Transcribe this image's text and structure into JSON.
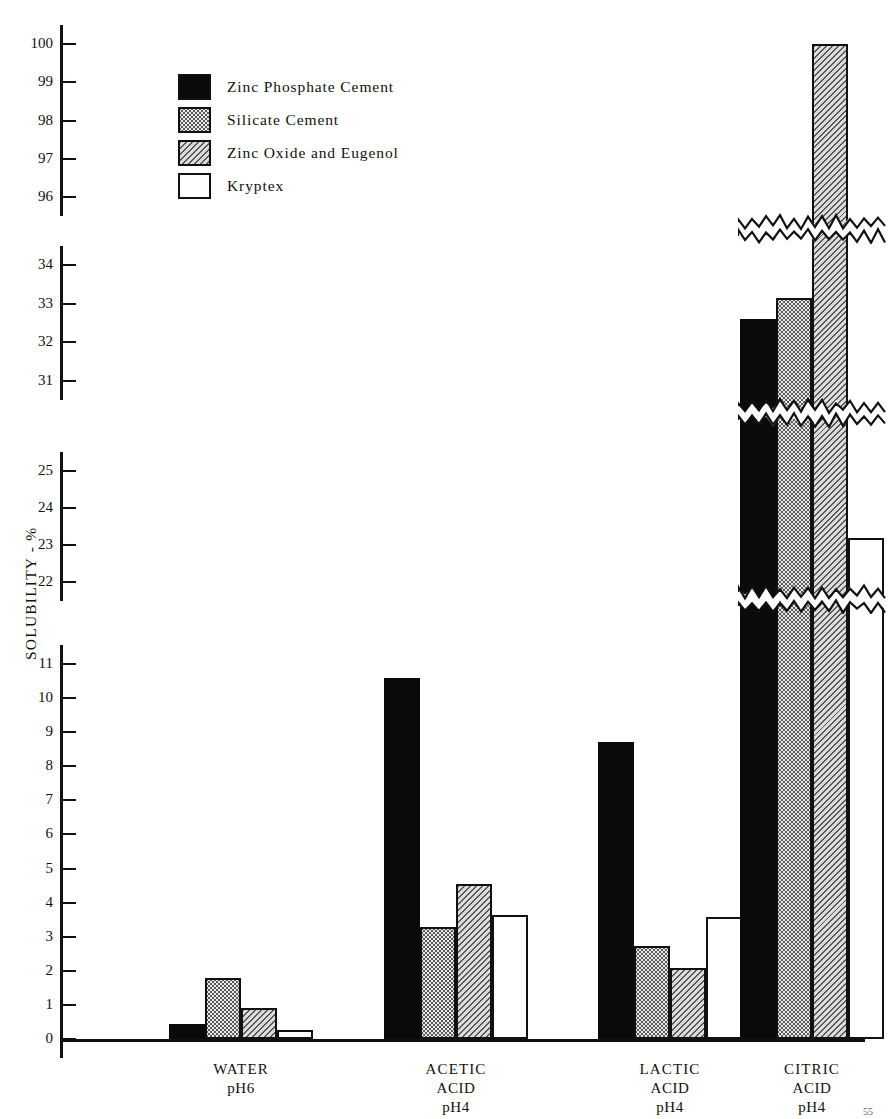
{
  "figure": {
    "ylabel": "SOLUBILITY - %",
    "corner_note": "55"
  },
  "legend": {
    "items": [
      {
        "label": "Zinc Phosphate Cement",
        "pattern": "solid",
        "swatch_name": "swatch-zinc-phosphate"
      },
      {
        "label": "Silicate Cement",
        "pattern": "dots",
        "swatch_name": "swatch-silicate"
      },
      {
        "label": "Zinc Oxide and Eugenol",
        "pattern": "hatch",
        "swatch_name": "swatch-zinc-oxide-eugenol"
      },
      {
        "label": "Kryptex",
        "pattern": "open",
        "swatch_name": "swatch-kryptex"
      }
    ]
  },
  "axis": {
    "segments": [
      {
        "name": "segment-96-100",
        "ticks": [
          "100",
          "99",
          "98",
          "97",
          "96"
        ]
      },
      {
        "name": "segment-31-34",
        "ticks": [
          "34",
          "33",
          "32",
          "31"
        ]
      },
      {
        "name": "segment-22-25",
        "ticks": [
          "25",
          "24",
          "23",
          "22"
        ]
      },
      {
        "name": "segment-0-11",
        "ticks": [
          "11",
          "10",
          "9",
          "8",
          "7",
          "6",
          "5",
          "4",
          "3",
          "2",
          "1",
          "0"
        ]
      }
    ]
  },
  "xaxis": {
    "groups": [
      {
        "name": "WATER",
        "line1": "WATER",
        "line2": "pH6",
        "line3": ""
      },
      {
        "name": "ACETIC",
        "line1": "ACETIC",
        "line2": "ACID",
        "line3": "pH4"
      },
      {
        "name": "LACTIC",
        "line1": "LACTIC",
        "line2": "ACID",
        "line3": "pH4"
      },
      {
        "name": "CITRIC",
        "line1": "CITRIC",
        "line2": "ACID",
        "line3": "pH4"
      }
    ]
  },
  "chart_data": {
    "type": "bar",
    "title": "",
    "xlabel": "",
    "ylabel": "SOLUBILITY - %",
    "grid": false,
    "legend_position": "upper-left",
    "broken_axis": true,
    "axis_segments": [
      {
        "range": [
          0,
          11
        ],
        "ticks": [
          0,
          1,
          2,
          3,
          4,
          5,
          6,
          7,
          8,
          9,
          10,
          11
        ]
      },
      {
        "range": [
          22,
          25
        ],
        "ticks": [
          22,
          23,
          24,
          25
        ]
      },
      {
        "range": [
          31,
          34
        ],
        "ticks": [
          31,
          32,
          33,
          34
        ]
      },
      {
        "range": [
          96,
          100
        ],
        "ticks": [
          96,
          97,
          98,
          99,
          100
        ]
      }
    ],
    "categories": [
      "WATER pH6",
      "ACETIC ACID pH4",
      "LACTIC ACID pH4",
      "CITRIC ACID pH4"
    ],
    "series": [
      {
        "name": "Zinc Phosphate Cement",
        "pattern": "solid",
        "values": [
          0.45,
          10.6,
          8.7,
          32.6
        ]
      },
      {
        "name": "Silicate Cement",
        "pattern": "dots",
        "values": [
          1.78,
          3.3,
          2.72,
          33.15
        ]
      },
      {
        "name": "Zinc Oxide and Eugenol",
        "pattern": "hatch",
        "values": [
          0.9,
          4.55,
          2.08,
          100.0
        ]
      },
      {
        "name": "Kryptex",
        "pattern": "open",
        "values": [
          0.27,
          3.65,
          3.58,
          23.2
        ]
      }
    ]
  }
}
